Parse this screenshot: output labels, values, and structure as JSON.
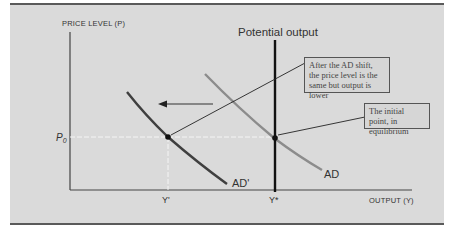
{
  "diagram": {
    "title": "Potential output",
    "y_axis_label": "PRICE LEVEL (P)",
    "x_axis_label": "OUTPUT (Y)",
    "price_label": "P",
    "price_subscript": "0",
    "y_prime_label": "Y'",
    "y_star_label": "Y*",
    "curve_ad_label": "AD",
    "curve_ad_prime_label": "AD'",
    "annotations": [
      {
        "text": "After the AD shift, the price level is the same but output is lower"
      },
      {
        "text": "The initial point, in equilibrium"
      }
    ],
    "colors": {
      "panel_bg": "#dadada",
      "ad_curve": "#8c8c8c",
      "ad_prime_curve": "#3f3f3f",
      "potential_line": "#111111",
      "guide_dashed": "#f5f5f5"
    }
  }
}
